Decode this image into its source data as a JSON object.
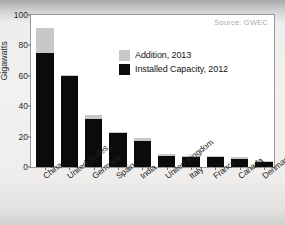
{
  "figure": {
    "source_note": "Source: GWEC",
    "y_axis_title": "Gigawatts"
  },
  "legend": {
    "items": [
      {
        "label": "Addition, 2013",
        "color": "#c8c8c8"
      },
      {
        "label": "Installed Capacity, 2012",
        "color": "#0b0b0b"
      }
    ]
  },
  "chart_data": {
    "type": "bar",
    "title": "",
    "subtitle": "",
    "xlabel": "",
    "ylabel": "Gigawatts",
    "ylim": [
      0,
      100
    ],
    "yticks": [
      0,
      20,
      40,
      60,
      80,
      100
    ],
    "ytick_labels": [
      "0",
      "20",
      "40",
      "60",
      "80",
      "100"
    ],
    "grid": false,
    "stacked": true,
    "legend_position": "upper-center",
    "annotations": [
      "Source: GWEC"
    ],
    "categories": [
      "China",
      "United States",
      "Germany",
      "Spain",
      "India",
      "United Kingdom",
      "Italy",
      "France",
      "Canada",
      "Denmark"
    ],
    "series": [
      {
        "name": "Installed Capacity, 2012",
        "color": "#0b0b0b",
        "values": [
          75.3,
          60.0,
          31.3,
          22.8,
          17.4,
          7.2,
          7.0,
          6.8,
          5.3,
          3.4
        ]
      },
      {
        "name": "Addition, 2013",
        "color": "#c8c8c8",
        "values": [
          16.1,
          0.7,
          3.2,
          0.2,
          1.7,
          1.2,
          0.3,
          0.3,
          1.2,
          0.3
        ]
      }
    ],
    "totals": [
      91.4,
      60.7,
      34.5,
      23.0,
      19.1,
      8.4,
      7.3,
      7.1,
      6.5,
      3.7
    ]
  }
}
